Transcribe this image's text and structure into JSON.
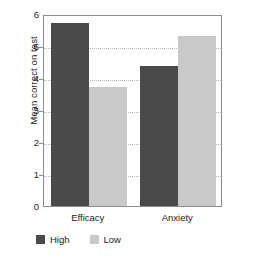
{
  "chart_data": {
    "type": "bar",
    "title": "",
    "xlabel": "",
    "ylabel": "Mean correct on test",
    "categories": [
      "Efficacy",
      "Anxiety"
    ],
    "series": [
      {
        "name": "High",
        "color": "#4a4a4a",
        "values": [
          5.72,
          4.37
        ]
      },
      {
        "name": "Low",
        "color": "#c9c9c9",
        "values": [
          3.72,
          5.32
        ]
      }
    ],
    "ylim": [
      0,
      6
    ],
    "yticks": [
      0,
      1,
      2,
      3,
      4,
      5,
      6
    ],
    "ytick_labels": [
      "0",
      "1",
      "2",
      "3",
      "4",
      "5",
      "6"
    ],
    "grid": true,
    "grid_style": "dotted-horizontal",
    "legend_position": "bottom-left",
    "frame_color": "#8c8c8c",
    "background": "#ffffff"
  }
}
